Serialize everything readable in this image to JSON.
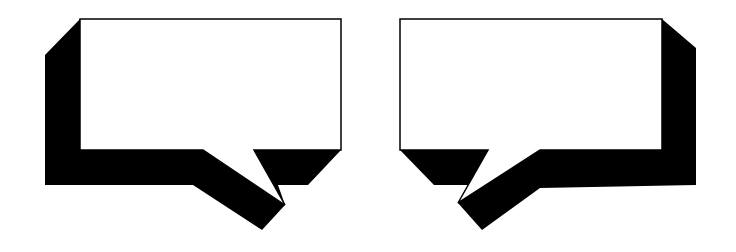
{
  "canvas": {
    "width": 736,
    "height": 252,
    "background": "#ffffff"
  },
  "colors": {
    "fill": "#ffffff",
    "shadow": "#000000",
    "stroke": "#000000"
  },
  "bubbles": [
    {
      "id": "left",
      "tail_direction": "bottom-right",
      "text": "",
      "body": "80,19 341,19 341,150 254,150 285,205 203,150 80,150",
      "shadow": "45,55 80,19 80,150 203,150 285,205 254,150 341,150 308,185 278,185 285,205 262,230 193,185 45,185"
    },
    {
      "id": "right",
      "tail_direction": "bottom-left",
      "text": "",
      "body": "400,19 662,19 662,150 540,150 458,203 488,150 400,150",
      "shadow": "662,19 696,48 696,185 540,188 482,230 458,203 540,150 662,150",
      "shadow_left": "400,150 488,150 473,185 434,185"
    }
  ]
}
